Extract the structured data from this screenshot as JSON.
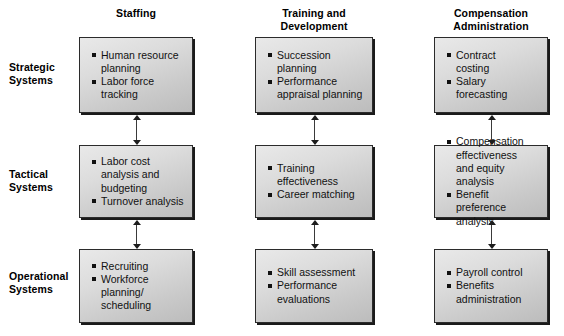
{
  "diagram": {
    "column_headers": [
      {
        "line1": "Staffing",
        "line2": ""
      },
      {
        "line1": "Training and",
        "line2": "Development"
      },
      {
        "line1": "Compensation",
        "line2": "Administration"
      }
    ],
    "row_labels": [
      {
        "line1": "Strategic",
        "line2": "Systems"
      },
      {
        "line1": "Tactical",
        "line2": "Systems"
      },
      {
        "line1": "Operational",
        "line2": "Systems"
      }
    ],
    "cells": [
      {
        "row": "Strategic Systems",
        "column": "Staffing",
        "items": [
          {
            "line1": "Human resource",
            "line2": "planning"
          },
          {
            "line1": "Labor force",
            "line2": "tracking"
          }
        ]
      },
      {
        "row": "Strategic Systems",
        "column": "Training and Development",
        "items": [
          {
            "line1": "Succession",
            "line2": "planning"
          },
          {
            "line1": "Performance",
            "line2": "appraisal planning"
          }
        ]
      },
      {
        "row": "Strategic Systems",
        "column": "Compensation Administration",
        "items": [
          {
            "line1": "Contract",
            "line2": "costing"
          },
          {
            "line1": "Salary",
            "line2": "forecasting"
          }
        ]
      },
      {
        "row": "Tactical Systems",
        "column": "Staffing",
        "items": [
          {
            "line1": "Labor cost",
            "line2": "analysis and",
            "line3": "budgeting"
          },
          {
            "line1": "Turnover analysis",
            "line2": ""
          }
        ]
      },
      {
        "row": "Tactical Systems",
        "column": "Training and Development",
        "items": [
          {
            "line1": "Training",
            "line2": "effectiveness"
          },
          {
            "line1": "Career matching",
            "line2": ""
          }
        ]
      },
      {
        "row": "Tactical Systems",
        "column": "Compensation Administration",
        "items": [
          {
            "line1": "Compensation",
            "line2": "effectiveness",
            "line3": "and equity analysis"
          },
          {
            "line1": "Benefit preference",
            "line2": "analysis"
          }
        ]
      },
      {
        "row": "Operational Systems",
        "column": "Staffing",
        "items": [
          {
            "line1": "Recruiting",
            "line2": ""
          },
          {
            "line1": "Workforce",
            "line2": "planning/",
            "line3": "scheduling"
          }
        ]
      },
      {
        "row": "Operational Systems",
        "column": "Training and Development",
        "items": [
          {
            "line1": "Skill assessment",
            "line2": ""
          },
          {
            "line1": "Performance",
            "line2": "evaluations"
          }
        ]
      },
      {
        "row": "Operational Systems",
        "column": "Compensation Administration",
        "items": [
          {
            "line1": "Payroll control",
            "line2": ""
          },
          {
            "line1": "Benefits",
            "line2": "administration"
          }
        ]
      }
    ],
    "connectors": {
      "type": "double-headed-vertical-arrow",
      "description": "Double-headed vertical arrows link each box to the box above/below within the same column",
      "count": 6
    },
    "colors": {
      "box_border": "#2b2b2b",
      "box_shadow": "#1a1a1a",
      "box_fill_light": "#e9e9e9",
      "box_fill_dark": "#bcbcbc",
      "text": "#000000",
      "arrow": "#1d1d1d",
      "background": "#ffffff"
    }
  }
}
